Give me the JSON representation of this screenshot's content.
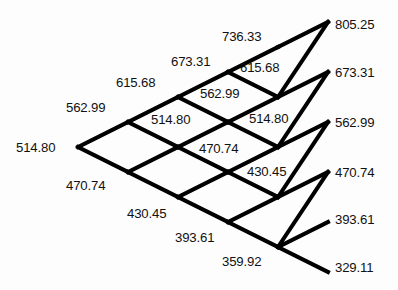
{
  "figure": {
    "type": "binomial-lattice",
    "title": "",
    "background_color": "#fdfdfd",
    "line_color": "#000000",
    "text_color": "#111111",
    "line_width": 4,
    "steps": 5,
    "dx": 50,
    "dy": 25,
    "origin": {
      "x": 78,
      "y": 147
    }
  },
  "chart_data": {
    "type": "tree",
    "title": "",
    "xlabel": "",
    "ylabel": "",
    "steps": 5,
    "levels": [
      {
        "step": 0,
        "values": [
          514.8
        ]
      },
      {
        "step": 1,
        "values": [
          562.99,
          470.74
        ]
      },
      {
        "step": 2,
        "values": [
          615.68,
          514.8,
          430.45
        ]
      },
      {
        "step": 3,
        "values": [
          673.31,
          562.99,
          470.74,
          393.61
        ]
      },
      {
        "step": 4,
        "values": [
          736.33,
          615.68,
          514.8,
          430.45,
          359.92
        ]
      },
      {
        "step": 5,
        "values": [
          805.25,
          673.31,
          562.99,
          470.74,
          393.61,
          329.11
        ]
      }
    ],
    "terminal_values": [
      805.25,
      673.31,
      562.99,
      470.74,
      393.61,
      329.11
    ],
    "up_factor": 1.0937,
    "down_factor": 0.9145
  },
  "nodes": [
    {
      "id": "n0-0",
      "text": "514.80",
      "x": 16,
      "y": 141,
      "align": "left",
      "step": 0,
      "level": 0
    },
    {
      "id": "n1-0",
      "text": "562.99",
      "x": 66,
      "y": 101,
      "align": "left",
      "step": 1,
      "level": 0
    },
    {
      "id": "n1-1",
      "text": "470.74",
      "x": 66,
      "y": 179,
      "align": "left",
      "step": 1,
      "level": 1
    },
    {
      "id": "n2-0",
      "text": "615.68",
      "x": 116,
      "y": 76,
      "align": "left",
      "step": 2,
      "level": 0
    },
    {
      "id": "n2-1",
      "text": "514.80",
      "x": 151,
      "y": 113,
      "align": "left",
      "step": 2,
      "level": 1
    },
    {
      "id": "n2-2",
      "text": "430.45",
      "x": 127,
      "y": 207,
      "align": "left",
      "step": 2,
      "level": 2
    },
    {
      "id": "n3-0",
      "text": "673.31",
      "x": 171,
      "y": 55,
      "align": "left",
      "step": 3,
      "level": 0
    },
    {
      "id": "n3-1",
      "text": "562.99",
      "x": 200,
      "y": 87,
      "align": "left",
      "step": 3,
      "level": 1
    },
    {
      "id": "n3-2",
      "text": "470.74",
      "x": 199,
      "y": 142,
      "align": "left",
      "step": 3,
      "level": 2
    },
    {
      "id": "n3-3",
      "text": "393.61",
      "x": 175,
      "y": 231,
      "align": "left",
      "step": 3,
      "level": 3
    },
    {
      "id": "n4-0",
      "text": "736.33",
      "x": 222,
      "y": 30,
      "align": "left",
      "step": 4,
      "level": 0
    },
    {
      "id": "n4-1",
      "text": "615.68",
      "x": 240,
      "y": 61,
      "align": "left",
      "step": 4,
      "level": 1
    },
    {
      "id": "n4-2",
      "text": "514.80",
      "x": 249,
      "y": 112,
      "align": "left",
      "step": 4,
      "level": 2
    },
    {
      "id": "n4-3",
      "text": "430.45",
      "x": 247,
      "y": 165,
      "align": "left",
      "step": 4,
      "level": 3
    },
    {
      "id": "n4-4",
      "text": "359.92",
      "x": 222,
      "y": 255,
      "align": "left",
      "step": 4,
      "level": 4
    },
    {
      "id": "n5-0",
      "text": "805.25",
      "x": 335,
      "y": 18,
      "align": "left",
      "step": 5,
      "level": 0
    },
    {
      "id": "n5-1",
      "text": "673.31",
      "x": 335,
      "y": 66,
      "align": "left",
      "step": 5,
      "level": 1
    },
    {
      "id": "n5-2",
      "text": "562.99",
      "x": 335,
      "y": 116,
      "align": "left",
      "step": 5,
      "level": 2
    },
    {
      "id": "n5-3",
      "text": "470.74",
      "x": 335,
      "y": 166,
      "align": "left",
      "step": 5,
      "level": 3
    },
    {
      "id": "n5-4",
      "text": "393.61",
      "x": 335,
      "y": 213,
      "align": "left",
      "step": 5,
      "level": 4
    },
    {
      "id": "n5-5",
      "text": "329.11",
      "x": 335,
      "y": 261,
      "align": "left",
      "step": 5,
      "level": 5
    }
  ],
  "edges": [
    {
      "from": "v0-0",
      "to": "v1-0"
    },
    {
      "from": "v0-0",
      "to": "v1-1"
    },
    {
      "from": "v1-0",
      "to": "v2-0"
    },
    {
      "from": "v1-0",
      "to": "v2-1"
    },
    {
      "from": "v1-1",
      "to": "v2-1"
    },
    {
      "from": "v1-1",
      "to": "v2-2"
    },
    {
      "from": "v2-0",
      "to": "v3-0"
    },
    {
      "from": "v2-0",
      "to": "v3-1"
    },
    {
      "from": "v2-1",
      "to": "v3-1"
    },
    {
      "from": "v2-1",
      "to": "v3-2"
    },
    {
      "from": "v2-2",
      "to": "v3-2"
    },
    {
      "from": "v2-2",
      "to": "v3-3"
    },
    {
      "from": "v3-0",
      "to": "v4-0"
    },
    {
      "from": "v3-0",
      "to": "v4-1"
    },
    {
      "from": "v3-1",
      "to": "v4-1"
    },
    {
      "from": "v3-1",
      "to": "v4-2"
    },
    {
      "from": "v3-2",
      "to": "v4-2"
    },
    {
      "from": "v3-2",
      "to": "v4-3"
    },
    {
      "from": "v3-3",
      "to": "v4-3"
    },
    {
      "from": "v3-3",
      "to": "v4-4"
    },
    {
      "from": "v4-0",
      "to": "v5-0"
    },
    {
      "from": "v4-1",
      "to": "v5-1"
    },
    {
      "from": "v4-1",
      "to": "v5-0"
    },
    {
      "from": "v4-2",
      "to": "v5-1"
    },
    {
      "from": "v4-2",
      "to": "v5-2"
    },
    {
      "from": "v4-3",
      "to": "v5-2"
    },
    {
      "from": "v4-3",
      "to": "v5-3"
    },
    {
      "from": "v4-4",
      "to": "v5-3"
    },
    {
      "from": "v4-4",
      "to": "v5-4"
    },
    {
      "from": "v4-4",
      "to": "v5-5"
    }
  ]
}
